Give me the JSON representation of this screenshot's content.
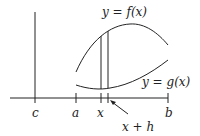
{
  "figure": {
    "labels": {
      "f_curve": "y = f(x)",
      "g_curve": "y = g(x)",
      "tick_c": "c",
      "tick_a": "a",
      "tick_x": "x",
      "tick_b": "b",
      "tick_xh": "x + h"
    },
    "colors": {
      "stroke": "#222222",
      "background": "#ffffff"
    }
  }
}
